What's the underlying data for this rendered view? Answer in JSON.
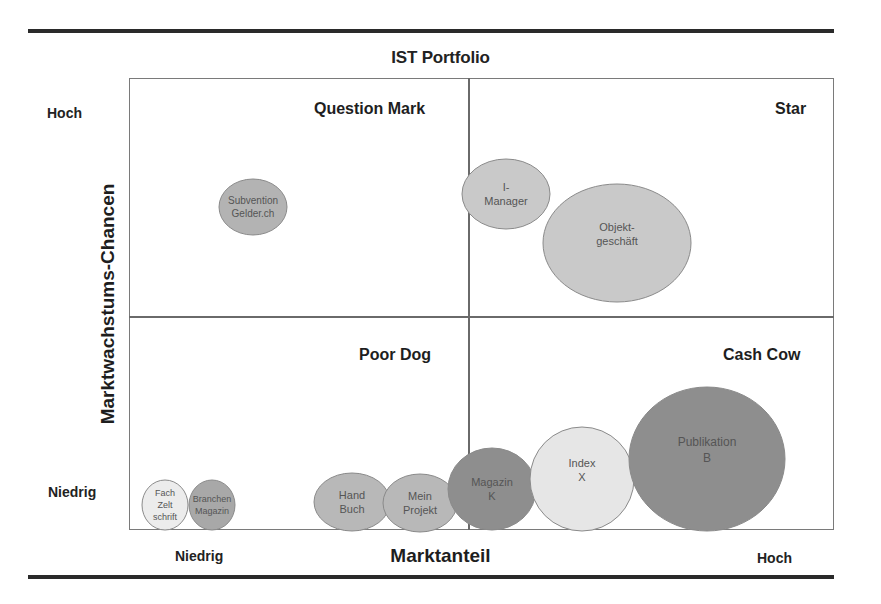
{
  "chart_data": {
    "type": "bubble-matrix",
    "title": "IST Portfolio",
    "xlabel": "Marktanteil",
    "ylabel": "Marktwachstums-Chancen",
    "x_axis": {
      "low_label": "Niedrig",
      "high_label": "Hoch"
    },
    "y_axis": {
      "low_label": "Niedrig",
      "high_label": "Hoch"
    },
    "quadrants": [
      {
        "position": "top-left",
        "label": "Question Mark"
      },
      {
        "position": "top-right",
        "label": "Star"
      },
      {
        "position": "bottom-left",
        "label": "Poor Dog"
      },
      {
        "position": "bottom-right",
        "label": "Cash Cow"
      }
    ],
    "grid": false,
    "legend": "none",
    "bubbles": [
      {
        "label": [
          "Subvention",
          "Gelder.ch"
        ],
        "quadrant": "Question Mark",
        "cx": 253,
        "cy": 207,
        "rx": 34,
        "ry": 28,
        "color": "#b3b3b3",
        "font_size": 10
      },
      {
        "label": [
          "I-",
          "Manager"
        ],
        "quadrant": "Star",
        "cx": 506,
        "cy": 194,
        "rx": 44,
        "ry": 35,
        "color": "#c9c9c9",
        "font_size": 11
      },
      {
        "label": [
          "Objekt-",
          "geschäft"
        ],
        "quadrant": "Star",
        "cx": 617,
        "cy": 243,
        "rx": 74,
        "ry": 59,
        "color": "#c9c9c9",
        "font_size": 11
      },
      {
        "label": [
          "Fach",
          "Zelt",
          "schrift"
        ],
        "quadrant": "Poor Dog",
        "cx": 165,
        "cy": 505,
        "rx": 23,
        "ry": 25,
        "color": "#ececec",
        "font_size": 9
      },
      {
        "label": [
          "Branchen",
          "Magazin"
        ],
        "quadrant": "Poor Dog",
        "cx": 212,
        "cy": 505,
        "rx": 23,
        "ry": 25,
        "color": "#a8a8a8",
        "font_size": 9
      },
      {
        "label": [
          "Hand",
          "Buch"
        ],
        "quadrant": "Poor Dog",
        "cx": 352,
        "cy": 502,
        "rx": 38,
        "ry": 29,
        "color": "#b8b8b8",
        "font_size": 11
      },
      {
        "label": [
          "Mein",
          "Projekt"
        ],
        "quadrant": "Poor Dog",
        "cx": 420,
        "cy": 503,
        "rx": 37,
        "ry": 29,
        "color": "#b8b8b8",
        "font_size": 11
      },
      {
        "label": [
          "Magazin",
          "K"
        ],
        "quadrant": "Cash Cow",
        "cx": 492,
        "cy": 489,
        "rx": 44,
        "ry": 41,
        "color": "#8e8e8e",
        "font_size": 11
      },
      {
        "label": [
          "Index",
          "X"
        ],
        "quadrant": "Cash Cow",
        "cx": 582,
        "cy": 479,
        "rx": 52,
        "ry": 52,
        "color": "#e6e6e6",
        "font_size": 11
      },
      {
        "label": [
          "Publikation",
          "B"
        ],
        "quadrant": "Cash Cow",
        "cx": 707,
        "cy": 459,
        "rx": 78,
        "ry": 72,
        "color": "#8e8e8e",
        "font_size": 12
      }
    ]
  },
  "labels": {
    "title": "IST Portfolio",
    "q_question_mark": "Question Mark",
    "q_star": "Star",
    "q_poor_dog": "Poor Dog",
    "q_cash_cow": "Cash Cow",
    "y_high": "Hoch",
    "y_low": "Niedrig",
    "x_low": "Niedrig",
    "x_high": "Hoch",
    "x_title": "Marktanteil",
    "y_title": "Marktwachstums-Chancen"
  },
  "colors": {
    "rule": "#2a2a2a",
    "frame": "#7a7a7a",
    "bubble_stroke": "#8a8a8a",
    "bubble_text": "#555555"
  }
}
